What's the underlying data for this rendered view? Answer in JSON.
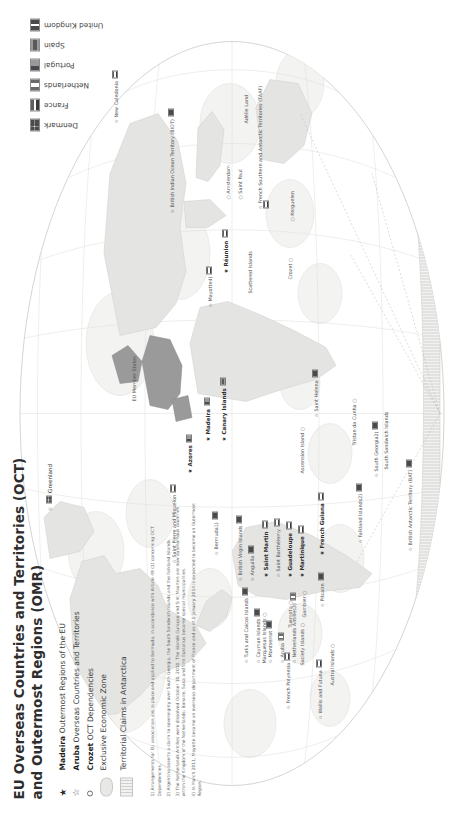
{
  "title": {
    "line1": "EU Overseas Countries and Territories (OCT)",
    "line2": "and Outermost Regions (OMR)"
  },
  "legend": {
    "items": [
      {
        "symbol": "filled-star",
        "name": "Madeira",
        "label": "Outermost Regions of the EU"
      },
      {
        "symbol": "open-star",
        "name": "Aruba",
        "label": "Overseas Countries and Territories"
      },
      {
        "symbol": "small-circle",
        "name": "Crozet",
        "label": "OCT Dependencies"
      },
      {
        "symbol": "eez-swatch",
        "name": "",
        "label": "Exclusive Economic Zone"
      },
      {
        "symbol": "antarctica-hatch",
        "name": "",
        "label": "Territorial Claims in Antarctica"
      }
    ]
  },
  "country_legend": {
    "items": [
      {
        "flag": "denmark-flag",
        "name": "Denmark"
      },
      {
        "flag": "france-flag",
        "name": "France"
      },
      {
        "flag": "netherlands-flag",
        "name": "Netherlands"
      },
      {
        "flag": "portugal-flag",
        "name": "Portugal"
      },
      {
        "flag": "spain-flag",
        "name": "Spain"
      },
      {
        "flag": "united-kingdom-flag",
        "name": "United Kingdom"
      }
    ]
  },
  "footnotes": [
    "1) Arrangements for EU association are in place and applied to Bermuda, in accordance with Article 49 (1) concerning OCT Dependencies.",
    "2) Argentina asserts a claim to sovereignty over South Georgia, the South Sandwich Islands and the Falkland Islands.",
    "3) The Netherlands Antilles were dissolved October 10, 2010. The islands Curaçao and Sint Maarten are now autonomous countries within the Kingdom of the Netherlands; Bonaire, Saba and Sint Eustatius became special municipalities.",
    "4) In March 2011, Mayotte became an overseas department of France and as of 1 January 2014 is expected to become an Outermost Region."
  ],
  "map_labels": {
    "atlantic_europe": [
      {
        "name": "Greenland",
        "marker": "open-star",
        "flag": "denmark-flag",
        "bold": false
      },
      {
        "name": "EU Member States",
        "marker": "none",
        "flag": "none",
        "bold": false
      },
      {
        "name": "Azores",
        "marker": "filled-star",
        "flag": "portugal-flag",
        "bold": true
      },
      {
        "name": "Madeira",
        "marker": "filled-star",
        "flag": "portugal-flag",
        "bold": true
      },
      {
        "name": "Canary Islands",
        "marker": "filled-star",
        "flag": "spain-flag",
        "bold": true
      },
      {
        "name": "Saint Pierre and Miquelon",
        "marker": "open-star",
        "flag": "france-flag",
        "bold": false
      },
      {
        "name": "Bermuda1)",
        "marker": "open-star",
        "flag": "united-kingdom-flag",
        "bold": false
      }
    ],
    "caribbean": [
      {
        "name": "Turks and Caicos Islands",
        "marker": "open-star",
        "flag": "united-kingdom-flag",
        "bold": false
      },
      {
        "name": "Cayman Islands",
        "marker": "open-star",
        "flag": "united-kingdom-flag",
        "bold": false
      },
      {
        "name": "Montserrat",
        "marker": "open-star",
        "flag": "united-kingdom-flag",
        "bold": false
      },
      {
        "name": "British Virgin Islands",
        "marker": "open-star",
        "flag": "united-kingdom-flag",
        "bold": false
      },
      {
        "name": "Anguilla",
        "marker": "open-star",
        "flag": "united-kingdom-flag",
        "bold": false
      },
      {
        "name": "Aruba",
        "marker": "open-star",
        "flag": "netherlands-flag",
        "bold": false
      },
      {
        "name": "Netherlands Antilles3)",
        "marker": "open-star",
        "flag": "netherlands-flag",
        "bold": false
      },
      {
        "name": "Saint Martin",
        "marker": "filled-star",
        "flag": "france-flag",
        "bold": true
      },
      {
        "name": "Saint Barthélemy",
        "marker": "open-star",
        "flag": "france-flag",
        "bold": false
      },
      {
        "name": "Guadeloupe",
        "marker": "filled-star",
        "flag": "france-flag",
        "bold": true
      },
      {
        "name": "Martinique",
        "marker": "filled-star",
        "flag": "france-flag",
        "bold": true
      },
      {
        "name": "French Guiana",
        "marker": "filled-star",
        "flag": "france-flag",
        "bold": true
      }
    ],
    "south_atlantic": [
      {
        "name": "Ascension Island",
        "marker": "small-circle",
        "flag": "none",
        "bold": false
      },
      {
        "name": "Saint Helena",
        "marker": "open-star",
        "flag": "united-kingdom-flag",
        "bold": false
      },
      {
        "name": "Tristan da Cunha",
        "marker": "small-circle",
        "flag": "none",
        "bold": false
      },
      {
        "name": "Falkland Islands2)",
        "marker": "open-star",
        "flag": "united-kingdom-flag",
        "bold": false
      },
      {
        "name": "South Georgia2)",
        "marker": "open-star",
        "flag": "united-kingdom-flag",
        "bold": false
      },
      {
        "name": "South Sandwich Islands",
        "marker": "none",
        "flag": "none",
        "bold": false
      },
      {
        "name": "British Antarctic Territory (BAT)",
        "marker": "open-star",
        "flag": "united-kingdom-flag",
        "bold": false
      }
    ],
    "indian_ocean": [
      {
        "name": "Réunion",
        "marker": "filled-star",
        "flag": "france-flag",
        "bold": true
      },
      {
        "name": "Mayotte4)",
        "marker": "open-star",
        "flag": "france-flag",
        "bold": false
      },
      {
        "name": "Scattered Islands",
        "marker": "small-circle",
        "flag": "none",
        "bold": false
      },
      {
        "name": "British Indian Ocean Territory (BIOT)",
        "marker": "open-star",
        "flag": "united-kingdom-flag",
        "bold": false
      },
      {
        "name": "Amsterdam",
        "marker": "small-circle",
        "flag": "none",
        "bold": false
      },
      {
        "name": "Saint Paul",
        "marker": "small-circle",
        "flag": "none",
        "bold": false
      },
      {
        "name": "French Southern and Antarctic Territories (TAAF)",
        "marker": "open-star",
        "flag": "france-flag",
        "bold": false
      },
      {
        "name": "Kerguelen",
        "marker": "small-circle",
        "flag": "none",
        "bold": false
      },
      {
        "name": "Crozet",
        "marker": "small-circle",
        "flag": "none",
        "bold": false
      },
      {
        "name": "Adélie Land",
        "marker": "none",
        "flag": "none",
        "bold": false
      }
    ],
    "pacific": [
      {
        "name": "New Caledonia",
        "marker": "open-star",
        "flag": "france-flag",
        "bold": false
      },
      {
        "name": "Wallis and Futuna",
        "marker": "open-star",
        "flag": "france-flag",
        "bold": false
      },
      {
        "name": "French Polynesia",
        "marker": "open-star",
        "flag": "france-flag",
        "bold": false
      },
      {
        "name": "Society Islands",
        "marker": "small-circle",
        "flag": "none",
        "bold": false
      },
      {
        "name": "Tuamotu",
        "marker": "small-circle",
        "flag": "none",
        "bold": false
      },
      {
        "name": "Gambier",
        "marker": "small-circle",
        "flag": "none",
        "bold": false
      },
      {
        "name": "Marquesas Islands",
        "marker": "small-circle",
        "flag": "none",
        "bold": false
      },
      {
        "name": "Austral Islands",
        "marker": "small-circle",
        "flag": "none",
        "bold": false
      },
      {
        "name": "Pitcairn",
        "marker": "open-star",
        "flag": "united-kingdom-flag",
        "bold": false
      }
    ]
  },
  "colors": {
    "ocean": "#ffffff",
    "land": "#e4e4e2",
    "eu_member": "#9a9a9a",
    "eez": "#efefed",
    "graticule": "#dcdcda",
    "text": "#2f2f2f"
  }
}
